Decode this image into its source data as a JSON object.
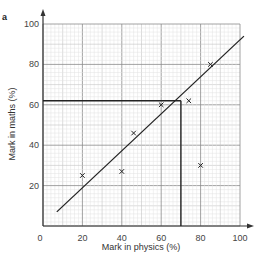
{
  "figure": {
    "part_label": "a"
  },
  "chart_data": {
    "type": "scatter",
    "title": "",
    "xlabel": "Mark in physics (%)",
    "ylabel": "Mark in maths (%)",
    "xlim": [
      0,
      100
    ],
    "ylim": [
      0,
      100
    ],
    "x_ticks": [
      0,
      20,
      40,
      60,
      80,
      100
    ],
    "y_ticks": [
      20,
      40,
      60,
      80,
      100
    ],
    "x_tick_labels": [
      "0",
      "20",
      "40",
      "60",
      "80",
      "100"
    ],
    "y_tick_labels": [
      "20",
      "40",
      "60",
      "80",
      "100"
    ],
    "grid": true,
    "marker": "x",
    "series": [
      {
        "name": "students",
        "points": [
          {
            "x": 20,
            "y": 25
          },
          {
            "x": 40,
            "y": 27
          },
          {
            "x": 46,
            "y": 46
          },
          {
            "x": 60,
            "y": 60
          },
          {
            "x": 74,
            "y": 62
          },
          {
            "x": 80,
            "y": 30
          },
          {
            "x": 85,
            "y": 80
          }
        ]
      }
    ],
    "line_of_best_fit": {
      "x1": 7,
      "y1": 7,
      "x2": 102,
      "y2": 94
    },
    "reading_lines": {
      "x": 70,
      "y": 62
    }
  }
}
